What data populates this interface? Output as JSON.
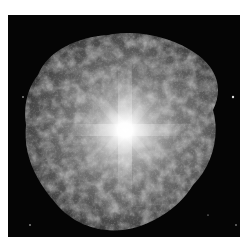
{
  "image": {
    "subject": "nebula-starburst",
    "description": "Grayscale astronomical image of a bright central star surrounded by a mottled, filamentary nebula on a black sky",
    "colors": {
      "page_background": "#ffffff",
      "sky": "#050505",
      "nebula": "#8a8a8a",
      "core": "#ffffff"
    },
    "frame": {
      "x": 8,
      "y": 15,
      "width": 232,
      "height": 222
    },
    "core_center": {
      "x": 125,
      "y": 130
    }
  }
}
